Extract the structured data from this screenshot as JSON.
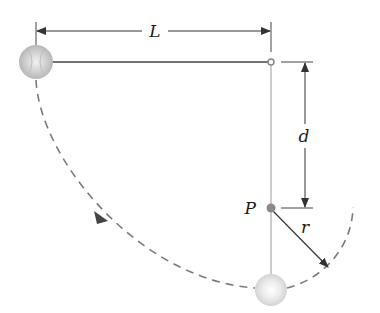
{
  "diagram": {
    "type": "pendulum-with-peg",
    "labels": {
      "length": "L",
      "peg_distance": "d",
      "peg_point": "P",
      "radius": "r"
    },
    "colors": {
      "line": "#333333",
      "string": "#999999",
      "dashed_path": "#777777",
      "ball": "#c8c8c8",
      "peg": "#888888"
    },
    "elements": {
      "ball_start": {
        "cx": 36,
        "cy": 62,
        "r": 17
      },
      "pivot": {
        "cx": 271,
        "cy": 62
      },
      "peg": {
        "cx": 271,
        "cy": 208
      },
      "ball_bottom": {
        "cx": 271,
        "cy": 290,
        "r": 16
      }
    }
  }
}
